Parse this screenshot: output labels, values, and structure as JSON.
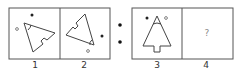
{
  "puzzle": {
    "type": "figure-analogy",
    "relation_symbol": "::",
    "panels": [
      {
        "label": "1",
        "content": "notched triangle with apex arc, solid dot and hollow dot"
      },
      {
        "label": "2",
        "content": "notched triangle rotated, solid dot and hollow dot"
      },
      {
        "label": "3",
        "content": "upright tree-shaped triangle with apex arc, solid dot and hollow dot"
      },
      {
        "label": "4",
        "content": "unknown",
        "text": "?"
      }
    ]
  }
}
